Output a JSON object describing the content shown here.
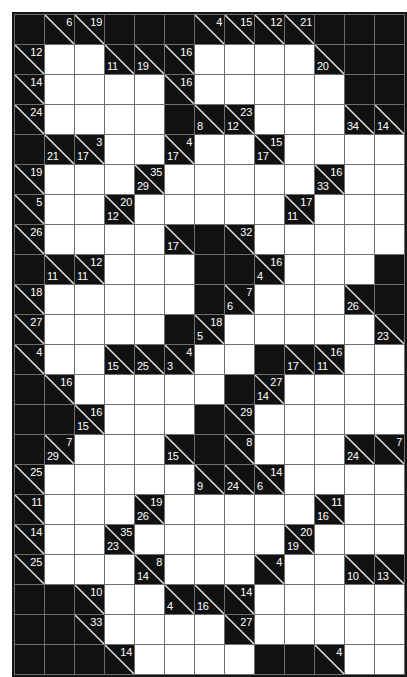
{
  "puzzle": {
    "name": "kakuro-grid",
    "type": "kakuro",
    "columns": 13,
    "rows": 19,
    "cell_size_px": 29,
    "colors": {
      "block": "#111111",
      "open": "#ffffff",
      "gridline": "#6e6e6e",
      "border": "#151515",
      "clue_text": "#ffffff",
      "slash": "#e9e9e9",
      "page_background": "#ffffff"
    },
    "legend": {
      "down_clue_position": "upper-right",
      "across_clue_position": "lower-left"
    },
    "cells": [
      [
        {
          "t": "block"
        },
        {
          "t": "clue",
          "down": "6"
        },
        {
          "t": "clue",
          "down": "19"
        },
        {
          "t": "block"
        },
        {
          "t": "block"
        },
        {
          "t": "block"
        },
        {
          "t": "clue",
          "down": "4"
        },
        {
          "t": "clue",
          "down": "15"
        },
        {
          "t": "clue",
          "down": "12"
        },
        {
          "t": "clue",
          "down": "21"
        },
        {
          "t": "block"
        },
        {
          "t": "block"
        },
        {
          "t": "block"
        }
      ],
      [
        {
          "t": "clue",
          "down": "12"
        },
        {
          "t": "open"
        },
        {
          "t": "open"
        },
        {
          "t": "clue",
          "across": "11"
        },
        {
          "t": "clue",
          "across": "19"
        },
        {
          "t": "clue",
          "down": "16"
        },
        {
          "t": "open"
        },
        {
          "t": "open"
        },
        {
          "t": "open"
        },
        {
          "t": "open"
        },
        {
          "t": "clue",
          "across": "20"
        },
        {
          "t": "block"
        },
        {
          "t": "block"
        }
      ],
      [
        {
          "t": "clue",
          "down": "14"
        },
        {
          "t": "open"
        },
        {
          "t": "open"
        },
        {
          "t": "open"
        },
        {
          "t": "open"
        },
        {
          "t": "clue",
          "down": "16"
        },
        {
          "t": "open"
        },
        {
          "t": "open"
        },
        {
          "t": "open"
        },
        {
          "t": "open"
        },
        {
          "t": "open"
        },
        {
          "t": "block"
        },
        {
          "t": "block"
        }
      ],
      [
        {
          "t": "clue",
          "down": "24"
        },
        {
          "t": "open"
        },
        {
          "t": "open"
        },
        {
          "t": "open"
        },
        {
          "t": "open"
        },
        {
          "t": "block"
        },
        {
          "t": "clue",
          "across": "8"
        },
        {
          "t": "clue",
          "down": "23",
          "across": "12"
        },
        {
          "t": "open"
        },
        {
          "t": "open"
        },
        {
          "t": "open"
        },
        {
          "t": "clue",
          "across": "34"
        },
        {
          "t": "clue",
          "across": "14"
        }
      ],
      [
        {
          "t": "block"
        },
        {
          "t": "clue",
          "across": "21"
        },
        {
          "t": "clue",
          "down": "3",
          "across": "17"
        },
        {
          "t": "open"
        },
        {
          "t": "open"
        },
        {
          "t": "clue",
          "down": "4",
          "across": "17"
        },
        {
          "t": "open"
        },
        {
          "t": "open"
        },
        {
          "t": "clue",
          "down": "15",
          "across": "17"
        },
        {
          "t": "open"
        },
        {
          "t": "open"
        },
        {
          "t": "open"
        },
        {
          "t": "open"
        }
      ],
      [
        {
          "t": "clue",
          "down": "19"
        },
        {
          "t": "open"
        },
        {
          "t": "open"
        },
        {
          "t": "open"
        },
        {
          "t": "clue",
          "down": "35",
          "across": "29"
        },
        {
          "t": "open"
        },
        {
          "t": "open"
        },
        {
          "t": "open"
        },
        {
          "t": "open"
        },
        {
          "t": "open"
        },
        {
          "t": "clue",
          "down": "16",
          "across": "33"
        },
        {
          "t": "open"
        },
        {
          "t": "open"
        }
      ],
      [
        {
          "t": "clue",
          "down": "5"
        },
        {
          "t": "open"
        },
        {
          "t": "open"
        },
        {
          "t": "clue",
          "down": "20",
          "across": "12"
        },
        {
          "t": "open"
        },
        {
          "t": "open"
        },
        {
          "t": "open"
        },
        {
          "t": "open"
        },
        {
          "t": "open"
        },
        {
          "t": "clue",
          "down": "17",
          "across": "11"
        },
        {
          "t": "open"
        },
        {
          "t": "open"
        },
        {
          "t": "open"
        }
      ],
      [
        {
          "t": "clue",
          "down": "26"
        },
        {
          "t": "open"
        },
        {
          "t": "open"
        },
        {
          "t": "open"
        },
        {
          "t": "open"
        },
        {
          "t": "clue",
          "across": "17"
        },
        {
          "t": "block"
        },
        {
          "t": "clue",
          "down": "32"
        },
        {
          "t": "open"
        },
        {
          "t": "open"
        },
        {
          "t": "open"
        },
        {
          "t": "open"
        },
        {
          "t": "open"
        }
      ],
      [
        {
          "t": "block"
        },
        {
          "t": "clue",
          "across": "11"
        },
        {
          "t": "clue",
          "down": "12",
          "across": "11"
        },
        {
          "t": "open"
        },
        {
          "t": "open"
        },
        {
          "t": "open"
        },
        {
          "t": "block"
        },
        {
          "t": "block"
        },
        {
          "t": "clue",
          "down": "16",
          "across": "4"
        },
        {
          "t": "open"
        },
        {
          "t": "open"
        },
        {
          "t": "open"
        },
        {
          "t": "block"
        }
      ],
      [
        {
          "t": "clue",
          "down": "18"
        },
        {
          "t": "open"
        },
        {
          "t": "open"
        },
        {
          "t": "open"
        },
        {
          "t": "open"
        },
        {
          "t": "open"
        },
        {
          "t": "block"
        },
        {
          "t": "clue",
          "down": "7",
          "across": "6"
        },
        {
          "t": "open"
        },
        {
          "t": "open"
        },
        {
          "t": "open"
        },
        {
          "t": "clue",
          "across": "26"
        },
        {
          "t": "block"
        }
      ],
      [
        {
          "t": "clue",
          "down": "27"
        },
        {
          "t": "open"
        },
        {
          "t": "open"
        },
        {
          "t": "open"
        },
        {
          "t": "open"
        },
        {
          "t": "block"
        },
        {
          "t": "clue",
          "down": "18",
          "across": "5"
        },
        {
          "t": "open"
        },
        {
          "t": "open"
        },
        {
          "t": "open"
        },
        {
          "t": "open"
        },
        {
          "t": "open"
        },
        {
          "t": "clue",
          "across": "23"
        }
      ],
      [
        {
          "t": "clue",
          "down": "4"
        },
        {
          "t": "open"
        },
        {
          "t": "open"
        },
        {
          "t": "clue",
          "across": "15"
        },
        {
          "t": "clue",
          "across": "25"
        },
        {
          "t": "clue",
          "down": "4",
          "across": "3"
        },
        {
          "t": "open"
        },
        {
          "t": "open"
        },
        {
          "t": "block"
        },
        {
          "t": "clue",
          "across": "17"
        },
        {
          "t": "clue",
          "down": "16",
          "across": "11"
        },
        {
          "t": "open"
        },
        {
          "t": "open"
        }
      ],
      [
        {
          "t": "block"
        },
        {
          "t": "clue",
          "down": "16"
        },
        {
          "t": "open"
        },
        {
          "t": "open"
        },
        {
          "t": "open"
        },
        {
          "t": "open"
        },
        {
          "t": "open"
        },
        {
          "t": "block"
        },
        {
          "t": "clue",
          "down": "27",
          "across": "14"
        },
        {
          "t": "open"
        },
        {
          "t": "open"
        },
        {
          "t": "open"
        },
        {
          "t": "open"
        }
      ],
      [
        {
          "t": "block"
        },
        {
          "t": "block"
        },
        {
          "t": "clue",
          "down": "16",
          "across": "15"
        },
        {
          "t": "open"
        },
        {
          "t": "open"
        },
        {
          "t": "open"
        },
        {
          "t": "block"
        },
        {
          "t": "clue",
          "down": "29"
        },
        {
          "t": "open"
        },
        {
          "t": "open"
        },
        {
          "t": "open"
        },
        {
          "t": "open"
        },
        {
          "t": "open"
        }
      ],
      [
        {
          "t": "block"
        },
        {
          "t": "clue",
          "down": "7",
          "across": "29"
        },
        {
          "t": "open"
        },
        {
          "t": "open"
        },
        {
          "t": "open"
        },
        {
          "t": "clue",
          "across": "15"
        },
        {
          "t": "block"
        },
        {
          "t": "clue",
          "down": "8"
        },
        {
          "t": "open"
        },
        {
          "t": "open"
        },
        {
          "t": "open"
        },
        {
          "t": "clue",
          "across": "24"
        },
        {
          "t": "clue",
          "down": "7"
        }
      ],
      [
        {
          "t": "clue",
          "down": "25"
        },
        {
          "t": "open"
        },
        {
          "t": "open"
        },
        {
          "t": "open"
        },
        {
          "t": "open"
        },
        {
          "t": "open"
        },
        {
          "t": "clue",
          "across": "9"
        },
        {
          "t": "clue",
          "across": "24"
        },
        {
          "t": "clue",
          "down": "14",
          "across": "6"
        },
        {
          "t": "open"
        },
        {
          "t": "open"
        },
        {
          "t": "open"
        },
        {
          "t": "open"
        }
      ],
      [
        {
          "t": "clue",
          "down": "11"
        },
        {
          "t": "open"
        },
        {
          "t": "open"
        },
        {
          "t": "open"
        },
        {
          "t": "clue",
          "down": "19",
          "across": "26"
        },
        {
          "t": "open"
        },
        {
          "t": "open"
        },
        {
          "t": "open"
        },
        {
          "t": "open"
        },
        {
          "t": "open"
        },
        {
          "t": "clue",
          "down": "11",
          "across": "16"
        },
        {
          "t": "open"
        },
        {
          "t": "open"
        }
      ],
      [
        {
          "t": "clue",
          "down": "14"
        },
        {
          "t": "open"
        },
        {
          "t": "open"
        },
        {
          "t": "clue",
          "down": "35",
          "across": "23"
        },
        {
          "t": "open"
        },
        {
          "t": "open"
        },
        {
          "t": "open"
        },
        {
          "t": "open"
        },
        {
          "t": "open"
        },
        {
          "t": "clue",
          "down": "20",
          "across": "19"
        },
        {
          "t": "open"
        },
        {
          "t": "open"
        },
        {
          "t": "open"
        }
      ],
      [
        {
          "t": "clue",
          "down": "25"
        },
        {
          "t": "open"
        },
        {
          "t": "open"
        },
        {
          "t": "open"
        },
        {
          "t": "clue",
          "down": "8",
          "across": "14"
        },
        {
          "t": "open"
        },
        {
          "t": "open"
        },
        {
          "t": "open"
        },
        {
          "t": "clue",
          "down": "4"
        },
        {
          "t": "open"
        },
        {
          "t": "open"
        },
        {
          "t": "clue",
          "across": "10"
        },
        {
          "t": "clue",
          "across": "13"
        }
      ],
      [
        {
          "t": "block"
        },
        {
          "t": "block"
        },
        {
          "t": "clue",
          "down": "10"
        },
        {
          "t": "open"
        },
        {
          "t": "open"
        },
        {
          "t": "clue",
          "across": "4"
        },
        {
          "t": "clue",
          "across": "16"
        },
        {
          "t": "clue",
          "down": "14"
        },
        {
          "t": "open"
        },
        {
          "t": "open"
        },
        {
          "t": "open"
        },
        {
          "t": "open"
        },
        {
          "t": "open"
        }
      ],
      [
        {
          "t": "block"
        },
        {
          "t": "block"
        },
        {
          "t": "clue",
          "down": "33"
        },
        {
          "t": "open"
        },
        {
          "t": "open"
        },
        {
          "t": "open"
        },
        {
          "t": "open"
        },
        {
          "t": "clue",
          "down": "27"
        },
        {
          "t": "open"
        },
        {
          "t": "open"
        },
        {
          "t": "open"
        },
        {
          "t": "open"
        },
        {
          "t": "open"
        }
      ],
      [
        {
          "t": "block"
        },
        {
          "t": "block"
        },
        {
          "t": "block"
        },
        {
          "t": "clue",
          "down": "14"
        },
        {
          "t": "open"
        },
        {
          "t": "open"
        },
        {
          "t": "open"
        },
        {
          "t": "open"
        },
        {
          "t": "block"
        },
        {
          "t": "block"
        },
        {
          "t": "clue",
          "down": "4"
        },
        {
          "t": "open"
        },
        {
          "t": "open"
        }
      ]
    ]
  }
}
